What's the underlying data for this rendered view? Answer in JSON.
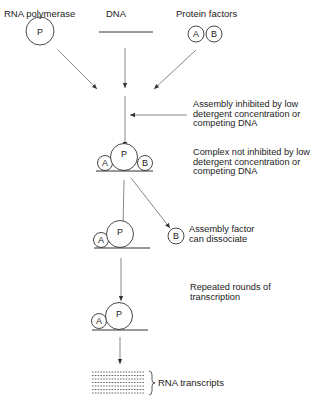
{
  "diagram": {
    "top_labels": {
      "rna_polymerase": "RNA polymerase",
      "dna": "DNA",
      "protein_factors": "Protein factors"
    },
    "components": {
      "polymerase_symbol": "P",
      "factor_a_symbol": "A",
      "factor_b_symbol": "B"
    },
    "annotations": {
      "assembly_inhibited": "Assembly inhibited by low detergent concentration or competing DNA",
      "complex_not_inhibited": "Complex not inhibited by low detergent concentration or competing DNA",
      "factor_dissociate": "Assembly factor can dissociate",
      "repeated_rounds": "Repeated rounds of transcription",
      "rna_transcripts": "RNA transcripts"
    },
    "colors": {
      "line": "#333333",
      "text": "#222222",
      "background": "#ffffff"
    }
  }
}
